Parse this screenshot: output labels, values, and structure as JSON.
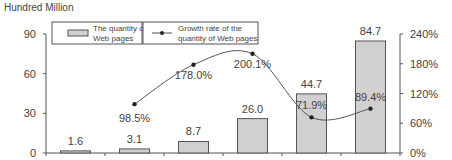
{
  "chart_data": {
    "type": "bar",
    "title": "",
    "unit_label": "Hundred Million",
    "categories": [
      "1",
      "2",
      "3",
      "4",
      "5",
      "6"
    ],
    "series": [
      {
        "name": "The quantity of Web pages",
        "type": "bar",
        "axis": "left",
        "values": [
          1.6,
          3.1,
          8.7,
          26.0,
          44.7,
          84.7
        ],
        "labels": [
          "1.6",
          "3.1",
          "8.7",
          "26.0",
          "44.7",
          "84.7"
        ]
      },
      {
        "name": "Growth rate of the quantity of Web pages",
        "type": "line",
        "axis": "right",
        "values": [
          null,
          98.5,
          178.0,
          200.1,
          71.9,
          89.4
        ],
        "labels": [
          "",
          "98.5%",
          "178.0%",
          "200.1%",
          "71.9%",
          "89.4%"
        ]
      }
    ],
    "left_axis": {
      "ylim": [
        0,
        90
      ],
      "ticks": [
        "0",
        "30",
        "60",
        "90"
      ]
    },
    "right_axis": {
      "ylim": [
        0,
        240
      ],
      "ticks": [
        "0%",
        "60%",
        "120%",
        "180%",
        "240%"
      ]
    },
    "xlabel": "",
    "grid": false,
    "legend_position": "top"
  },
  "legend": {
    "bar_label_1": "The quantity of",
    "bar_label_2": "Web pages",
    "line_label_1": "Growth rate of the",
    "line_label_2": "quantity of Web pages"
  },
  "colors": {
    "bar_fill": "#d0d0d0",
    "bar_stroke": "#555555",
    "line": "#555555",
    "axis": "#555555"
  }
}
